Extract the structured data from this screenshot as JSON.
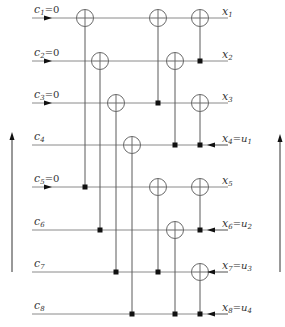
{
  "figure": {
    "inputs": [
      {
        "label": "c",
        "sub": "1",
        "suffix": "=0",
        "y": 18
      },
      {
        "label": "c",
        "sub": "2",
        "suffix": "=0",
        "y": 61
      },
      {
        "label": "c",
        "sub": "3",
        "suffix": "=0",
        "y": 103
      },
      {
        "label": "c",
        "sub": "4",
        "suffix": "",
        "y": 145
      },
      {
        "label": "c",
        "sub": "5",
        "suffix": "=0",
        "y": 187
      },
      {
        "label": "c",
        "sub": "6",
        "suffix": "",
        "y": 230
      },
      {
        "label": "c",
        "sub": "7",
        "suffix": "",
        "y": 272
      },
      {
        "label": "c",
        "sub": "8",
        "suffix": "",
        "y": 314
      }
    ],
    "outputs": [
      {
        "label": "x",
        "sub": "1",
        "extra": "",
        "extra_sub": "",
        "y": 18,
        "arrow_in": false
      },
      {
        "label": "x",
        "sub": "2",
        "extra": "",
        "extra_sub": "",
        "y": 61,
        "arrow_in": false
      },
      {
        "label": "x",
        "sub": "3",
        "extra": "",
        "extra_sub": "",
        "y": 103,
        "arrow_in": false
      },
      {
        "label": "x",
        "sub": "4",
        "extra": "=u",
        "extra_sub": "1",
        "y": 145,
        "arrow_in": true
      },
      {
        "label": "x",
        "sub": "5",
        "extra": "",
        "extra_sub": "",
        "y": 187,
        "arrow_in": false
      },
      {
        "label": "x",
        "sub": "6",
        "extra": "=u",
        "extra_sub": "2",
        "y": 230,
        "arrow_in": true
      },
      {
        "label": "x",
        "sub": "7",
        "extra": "=u",
        "extra_sub": "3",
        "y": 272,
        "arrow_in": true
      },
      {
        "label": "x",
        "sub": "8",
        "extra": "=u",
        "extra_sub": "4",
        "y": 314,
        "arrow_in": true
      }
    ],
    "input_arrows_on_rows": [
      1,
      2,
      3,
      5
    ],
    "gates": [
      {
        "x": 85,
        "target": 1,
        "control": 5
      },
      {
        "x": 100,
        "target": 2,
        "control": 6
      },
      {
        "x": 116,
        "target": 3,
        "control": 7
      },
      {
        "x": 132,
        "target": 4,
        "control": 8
      },
      {
        "x": 158,
        "target": 1,
        "control": 3
      },
      {
        "x": 158,
        "target": 5,
        "control": 7
      },
      {
        "x": 175,
        "target": 2,
        "control": 4
      },
      {
        "x": 175,
        "target": 6,
        "control": 8
      },
      {
        "x": 200,
        "target": 1,
        "control": 2
      },
      {
        "x": 200,
        "target": 3,
        "control": 4
      },
      {
        "x": 200,
        "target": 5,
        "control": 6
      },
      {
        "x": 200,
        "target": 7,
        "control": 8
      }
    ],
    "side_arrows": [
      {
        "name": "left-flow-arrow",
        "x": 12,
        "y_from": 272,
        "y_to": 134
      },
      {
        "name": "right-flow-arrow",
        "x": 280,
        "y_from": 272,
        "y_to": 136
      }
    ],
    "colors": {
      "wire": "#8a8a8a",
      "control": "#111111",
      "background": "#ffffff"
    }
  }
}
